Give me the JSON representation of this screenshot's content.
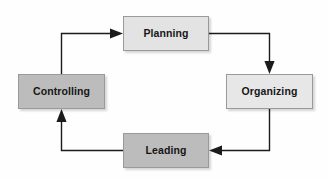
{
  "diagram": {
    "background_color": "#fefefe",
    "nodes": [
      {
        "id": "planning",
        "label": "Planning",
        "position": "top",
        "fill_color": "#e3e3e3",
        "border_color": "#9a9a9a",
        "text_color": "#161616"
      },
      {
        "id": "organizing",
        "label": "Organizing",
        "position": "right",
        "fill_color": "#e7e7e7",
        "border_color": "#9a9a9a",
        "text_color": "#161616"
      },
      {
        "id": "leading",
        "label": "Leading",
        "position": "bottom",
        "fill_color": "#bcbcbc",
        "border_color": "#9a9a9a",
        "text_color": "#161616"
      },
      {
        "id": "controlling",
        "label": "Controlling",
        "position": "left",
        "fill_color": "#bcbcbc",
        "border_color": "#9a9a9a",
        "text_color": "#161616"
      }
    ],
    "connectors": [
      {
        "id": "controlling-to-planning",
        "from": "controlling",
        "to": "planning",
        "direction": "right",
        "stroke_color": "#1b1b1b"
      },
      {
        "id": "planning-to-organizing",
        "from": "planning",
        "to": "organizing",
        "direction": "down",
        "stroke_color": "#1b1b1b"
      },
      {
        "id": "organizing-to-leading",
        "from": "organizing",
        "to": "leading",
        "direction": "left",
        "stroke_color": "#1b1b1b"
      },
      {
        "id": "leading-to-controlling",
        "from": "leading",
        "to": "controlling",
        "direction": "up",
        "stroke_color": "#1b1b1b"
      }
    ]
  }
}
